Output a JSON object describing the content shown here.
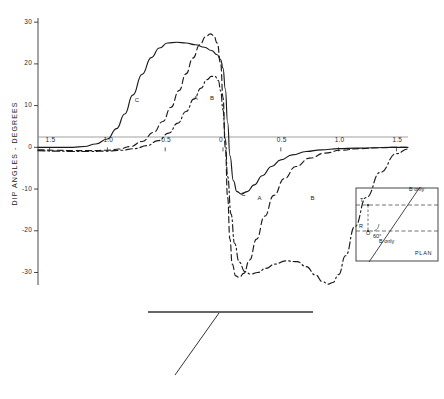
{
  "figure": {
    "kind": "dip-angle-anomaly-profile",
    "axis": {
      "ylabel": "DIP ANGLES - DEGREES",
      "yticks": [
        "30",
        "20",
        "10",
        "0",
        "-10",
        "-20",
        "-30"
      ],
      "yvalues": [
        30,
        20,
        10,
        0,
        -10,
        -20,
        -30
      ],
      "ylim": [
        -33,
        31
      ],
      "xticks_left": [
        "1.5",
        "1.0",
        "0.5",
        "0"
      ],
      "xticks_right": [
        "0",
        "0.5",
        "1.0",
        "1.5"
      ],
      "xlim": [
        -1.6,
        1.6
      ],
      "zero_line": true
    },
    "curve_labels_upper": [
      "C",
      "A",
      "B"
    ],
    "curve_labels_lower": [
      "C",
      "A",
      "B"
    ]
  },
  "inset": {
    "title": "PLAN",
    "label_top": "B only",
    "label_bottom": "B only",
    "transmitter": "T",
    "receiver": "R",
    "origin": "O",
    "angle": "60°"
  },
  "chart_data": {
    "type": "line",
    "title": "",
    "xlabel": "",
    "ylabel": "DIP ANGLES - DEGREES",
    "xlim": [
      -1.6,
      1.6
    ],
    "ylim": [
      -33,
      31
    ],
    "grid": false,
    "legend": "inline-curve-labels",
    "xticks": [
      -1.5,
      -1.0,
      -0.5,
      0,
      0.5,
      1.0,
      1.5
    ],
    "xticklabels": [
      "1.5",
      "1.0",
      "0.5",
      "0",
      "0.5",
      "1.0",
      "1.5"
    ],
    "yticks": [
      30,
      20,
      10,
      0,
      -10,
      -20,
      -30
    ],
    "series": [
      {
        "name": "C",
        "style": "solid",
        "peak": 25,
        "trough": -11,
        "x": [
          -1.6,
          -1.45,
          -1.3,
          -1.2,
          -1.1,
          -1.0,
          -0.92,
          -0.85,
          -0.78,
          -0.7,
          -0.62,
          -0.55,
          -0.48,
          -0.4,
          -0.32,
          -0.24,
          -0.16,
          -0.1,
          -0.05,
          -0.02,
          0.0,
          0.02,
          0.04,
          0.06,
          0.09,
          0.12,
          0.16,
          0.21,
          0.27,
          0.34,
          0.42,
          0.5,
          0.6,
          0.72,
          0.85,
          1.0,
          1.15,
          1.3,
          1.45,
          1.6
        ],
        "y": [
          0.0,
          0.0,
          0.0,
          0.2,
          0.8,
          2.0,
          4.5,
          8.0,
          12.5,
          17.5,
          21.5,
          23.8,
          25.0,
          25.2,
          25.0,
          24.6,
          24.0,
          23.2,
          22.2,
          21.0,
          19.0,
          14.0,
          6.0,
          -2.0,
          -8.0,
          -10.6,
          -11.2,
          -10.6,
          -9.0,
          -6.8,
          -4.6,
          -3.0,
          -1.8,
          -1.0,
          -0.6,
          -0.3,
          -0.2,
          -0.1,
          0.0,
          0.0
        ]
      },
      {
        "name": "A",
        "style": "dashed",
        "peak": 27,
        "trough": -31,
        "x": [
          -1.6,
          -1.45,
          -1.3,
          -1.15,
          -1.0,
          -0.9,
          -0.8,
          -0.7,
          -0.6,
          -0.52,
          -0.45,
          -0.38,
          -0.32,
          -0.26,
          -0.2,
          -0.15,
          -0.11,
          -0.08,
          -0.05,
          -0.02,
          0.0,
          0.02,
          0.04,
          0.06,
          0.08,
          0.11,
          0.14,
          0.18,
          0.23,
          0.29,
          0.36,
          0.44,
          0.53,
          0.63,
          0.75,
          0.88,
          1.02,
          1.18,
          1.35,
          1.5,
          1.6
        ],
        "y": [
          -0.6,
          -0.7,
          -0.8,
          -0.8,
          -0.7,
          -0.4,
          0.2,
          1.4,
          3.6,
          6.2,
          9.6,
          13.6,
          17.6,
          21.4,
          24.6,
          26.5,
          27.2,
          26.8,
          25.0,
          20.0,
          12.0,
          0.0,
          -12.0,
          -22.0,
          -28.0,
          -30.8,
          -31.2,
          -30.2,
          -27.0,
          -22.0,
          -16.5,
          -11.5,
          -7.5,
          -4.6,
          -2.6,
          -1.4,
          -0.7,
          -0.3,
          -0.1,
          0.0,
          0.0
        ]
      },
      {
        "name": "B",
        "style": "dashdot",
        "peak": 17,
        "trough": -33,
        "x": [
          -1.6,
          -1.45,
          -1.3,
          -1.15,
          -1.0,
          -0.88,
          -0.76,
          -0.66,
          -0.56,
          -0.47,
          -0.39,
          -0.32,
          -0.25,
          -0.19,
          -0.14,
          -0.1,
          -0.07,
          -0.04,
          -0.02,
          0.0,
          0.02,
          0.04,
          0.07,
          0.1,
          0.14,
          0.19,
          0.24,
          0.3,
          0.37,
          0.45,
          0.54,
          0.64,
          0.72,
          0.8,
          0.86,
          0.91,
          0.95,
          1.0,
          1.06,
          1.14,
          1.24,
          1.36,
          1.5,
          1.6
        ],
        "y": [
          -0.8,
          -0.9,
          -1.0,
          -1.0,
          -0.9,
          -0.7,
          -0.3,
          0.4,
          1.6,
          3.4,
          5.8,
          8.6,
          11.6,
          14.2,
          16.2,
          17.0,
          17.0,
          16.0,
          13.5,
          9.0,
          2.0,
          -7.0,
          -16.0,
          -23.0,
          -27.5,
          -29.8,
          -30.4,
          -30.0,
          -29.0,
          -28.0,
          -27.2,
          -27.4,
          -28.6,
          -30.6,
          -32.2,
          -32.8,
          -32.4,
          -30.5,
          -26.0,
          -19.0,
          -12.0,
          -6.0,
          -1.5,
          -0.4
        ]
      }
    ]
  }
}
